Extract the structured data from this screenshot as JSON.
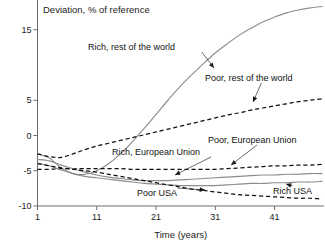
{
  "chart_data": {
    "type": "line",
    "title": "Deviation, % of reference",
    "xlabel": "Time (years)",
    "ylabel": "",
    "xlim": [
      1,
      49
    ],
    "ylim": [
      -10,
      20
    ],
    "grid": false,
    "legend_position": "inline-annotations",
    "xticks": [
      "1",
      "11",
      "21",
      "31",
      "41"
    ],
    "xtick_values": [
      1,
      11,
      21,
      31,
      41
    ],
    "yticks": [
      "20",
      "15",
      "5",
      "0",
      "-5",
      "-10"
    ],
    "ytick_values": [
      20,
      15,
      5,
      0,
      -5,
      -10
    ],
    "x": [
      1,
      3,
      5,
      7,
      9,
      11,
      13,
      15,
      17,
      19,
      21,
      23,
      25,
      27,
      29,
      31,
      33,
      35,
      37,
      39,
      41,
      43,
      45,
      47,
      49
    ],
    "series": [
      {
        "name": "Rich, rest of the world",
        "style": "solid",
        "color": "#8d8d8d",
        "values": [
          -2.6,
          -3.2,
          -4.6,
          -5.4,
          -5.5,
          -5.0,
          -4.0,
          -2.6,
          -0.9,
          1.0,
          3.0,
          5.0,
          6.9,
          8.6,
          10.2,
          11.7,
          13.0,
          14.2,
          15.2,
          16.1,
          16.8,
          17.4,
          17.8,
          18.1,
          18.3
        ]
      },
      {
        "name": "Poor, rest of the world",
        "style": "dashed",
        "color": "#111111",
        "values": [
          -2.6,
          -3.0,
          -3.1,
          -2.6,
          -2.0,
          -1.5,
          -1.1,
          -0.7,
          -0.3,
          0.1,
          0.5,
          0.9,
          1.3,
          1.7,
          2.1,
          2.5,
          2.9,
          3.2,
          3.6,
          3.9,
          4.2,
          4.5,
          4.8,
          5.0,
          5.2
        ]
      },
      {
        "name": "Poor, European Union",
        "style": "dashed",
        "color": "#111111",
        "values": [
          -4.8,
          -4.8,
          -4.7,
          -4.7,
          -4.7,
          -4.7,
          -4.7,
          -4.7,
          -4.8,
          -4.8,
          -4.8,
          -4.8,
          -4.8,
          -4.8,
          -4.8,
          -4.8,
          -4.7,
          -4.6,
          -4.5,
          -4.4,
          -4.3,
          -4.3,
          -4.2,
          -4.2,
          -4.1
        ]
      },
      {
        "name": "Rich, European Union",
        "style": "solid",
        "color": "#8d8d8d",
        "values": [
          -3.4,
          -3.6,
          -4.2,
          -4.7,
          -5.2,
          -5.6,
          -5.9,
          -6.1,
          -6.3,
          -6.4,
          -6.4,
          -6.4,
          -6.3,
          -6.2,
          -6.1,
          -6.0,
          -5.9,
          -5.8,
          -5.7,
          -5.6,
          -5.6,
          -5.5,
          -5.5,
          -5.4,
          -5.4
        ]
      },
      {
        "name": "Rich USA",
        "style": "solid",
        "color": "#8d8d8d",
        "values": [
          -3.9,
          -4.3,
          -4.9,
          -5.4,
          -5.8,
          -6.0,
          -6.2,
          -6.4,
          -6.6,
          -6.8,
          -6.9,
          -7.0,
          -7.1,
          -7.1,
          -7.1,
          -7.1,
          -7.0,
          -6.9,
          -6.8,
          -6.8,
          -6.7,
          -6.7,
          -6.6,
          -6.6,
          -6.5
        ]
      },
      {
        "name": "Poor USA",
        "style": "dashed",
        "color": "#111111",
        "values": [
          -4.0,
          -4.3,
          -4.6,
          -4.8,
          -5.0,
          -5.2,
          -5.5,
          -5.8,
          -6.1,
          -6.4,
          -6.7,
          -7.0,
          -7.3,
          -7.6,
          -7.8,
          -8.0,
          -8.2,
          -8.4,
          -8.5,
          -8.6,
          -8.7,
          -8.8,
          -8.9,
          -8.9,
          -9.0
        ]
      }
    ],
    "annotations": [
      {
        "text": "Rich, rest of the world",
        "label_x": 88,
        "label_y": 50,
        "point_x": 214,
        "point_y": 68
      },
      {
        "text": "Poor, rest of the world",
        "label_x": 205,
        "label_y": 81,
        "point_x": 253,
        "point_y": 102
      },
      {
        "text": "Poor, European Union",
        "label_x": 208,
        "label_y": 143,
        "point_x": 231,
        "point_y": 165
      },
      {
        "text": "Rich, European Union",
        "label_x": 112,
        "label_y": 155,
        "point_x": 175,
        "point_y": 175
      },
      {
        "text": "Rich USA",
        "label_x": 273,
        "label_y": 194,
        "point_x": 286,
        "point_y": 184
      },
      {
        "text": "Poor USA",
        "label_x": 137,
        "label_y": 196,
        "point_x": 205,
        "point_y": 190
      }
    ]
  }
}
